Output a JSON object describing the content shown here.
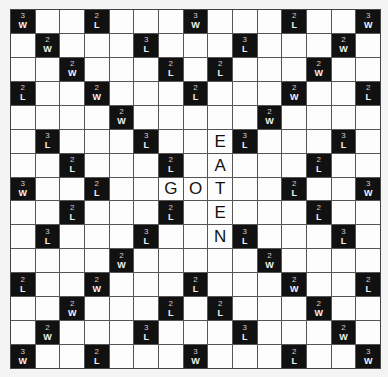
{
  "board": {
    "size": 15,
    "premium_squares": [
      {
        "row": 0,
        "col": 0,
        "mult": "3",
        "kind": "W"
      },
      {
        "row": 0,
        "col": 3,
        "mult": "2",
        "kind": "L"
      },
      {
        "row": 0,
        "col": 7,
        "mult": "3",
        "kind": "W"
      },
      {
        "row": 0,
        "col": 11,
        "mult": "2",
        "kind": "L"
      },
      {
        "row": 0,
        "col": 14,
        "mult": "3",
        "kind": "W"
      },
      {
        "row": 1,
        "col": 1,
        "mult": "2",
        "kind": "W"
      },
      {
        "row": 1,
        "col": 5,
        "mult": "3",
        "kind": "L"
      },
      {
        "row": 1,
        "col": 9,
        "mult": "3",
        "kind": "L"
      },
      {
        "row": 1,
        "col": 13,
        "mult": "2",
        "kind": "W"
      },
      {
        "row": 2,
        "col": 2,
        "mult": "2",
        "kind": "W"
      },
      {
        "row": 2,
        "col": 6,
        "mult": "2",
        "kind": "L"
      },
      {
        "row": 2,
        "col": 8,
        "mult": "2",
        "kind": "L"
      },
      {
        "row": 2,
        "col": 12,
        "mult": "2",
        "kind": "W"
      },
      {
        "row": 3,
        "col": 0,
        "mult": "2",
        "kind": "L"
      },
      {
        "row": 3,
        "col": 3,
        "mult": "2",
        "kind": "W"
      },
      {
        "row": 3,
        "col": 7,
        "mult": "2",
        "kind": "L"
      },
      {
        "row": 3,
        "col": 11,
        "mult": "2",
        "kind": "W"
      },
      {
        "row": 3,
        "col": 14,
        "mult": "2",
        "kind": "L"
      },
      {
        "row": 4,
        "col": 4,
        "mult": "2",
        "kind": "W"
      },
      {
        "row": 4,
        "col": 10,
        "mult": "2",
        "kind": "W"
      },
      {
        "row": 5,
        "col": 1,
        "mult": "3",
        "kind": "L"
      },
      {
        "row": 5,
        "col": 5,
        "mult": "3",
        "kind": "L"
      },
      {
        "row": 5,
        "col": 9,
        "mult": "3",
        "kind": "L"
      },
      {
        "row": 5,
        "col": 13,
        "mult": "3",
        "kind": "L"
      },
      {
        "row": 6,
        "col": 2,
        "mult": "2",
        "kind": "L"
      },
      {
        "row": 6,
        "col": 6,
        "mult": "2",
        "kind": "L"
      },
      {
        "row": 6,
        "col": 12,
        "mult": "2",
        "kind": "L"
      },
      {
        "row": 7,
        "col": 0,
        "mult": "3",
        "kind": "W"
      },
      {
        "row": 7,
        "col": 3,
        "mult": "2",
        "kind": "L"
      },
      {
        "row": 7,
        "col": 11,
        "mult": "2",
        "kind": "L"
      },
      {
        "row": 7,
        "col": 14,
        "mult": "3",
        "kind": "W"
      },
      {
        "row": 8,
        "col": 2,
        "mult": "2",
        "kind": "L"
      },
      {
        "row": 8,
        "col": 6,
        "mult": "2",
        "kind": "L"
      },
      {
        "row": 8,
        "col": 12,
        "mult": "2",
        "kind": "L"
      },
      {
        "row": 9,
        "col": 1,
        "mult": "3",
        "kind": "L"
      },
      {
        "row": 9,
        "col": 5,
        "mult": "3",
        "kind": "L"
      },
      {
        "row": 9,
        "col": 9,
        "mult": "3",
        "kind": "L"
      },
      {
        "row": 9,
        "col": 13,
        "mult": "3",
        "kind": "L"
      },
      {
        "row": 10,
        "col": 4,
        "mult": "2",
        "kind": "W"
      },
      {
        "row": 10,
        "col": 10,
        "mult": "2",
        "kind": "W"
      },
      {
        "row": 11,
        "col": 0,
        "mult": "2",
        "kind": "L"
      },
      {
        "row": 11,
        "col": 3,
        "mult": "2",
        "kind": "W"
      },
      {
        "row": 11,
        "col": 7,
        "mult": "2",
        "kind": "L"
      },
      {
        "row": 11,
        "col": 11,
        "mult": "2",
        "kind": "W"
      },
      {
        "row": 11,
        "col": 14,
        "mult": "2",
        "kind": "L"
      },
      {
        "row": 12,
        "col": 2,
        "mult": "2",
        "kind": "W"
      },
      {
        "row": 12,
        "col": 6,
        "mult": "2",
        "kind": "L"
      },
      {
        "row": 12,
        "col": 8,
        "mult": "2",
        "kind": "L"
      },
      {
        "row": 12,
        "col": 12,
        "mult": "2",
        "kind": "W"
      },
      {
        "row": 13,
        "col": 1,
        "mult": "2",
        "kind": "W"
      },
      {
        "row": 13,
        "col": 5,
        "mult": "3",
        "kind": "L"
      },
      {
        "row": 13,
        "col": 9,
        "mult": "3",
        "kind": "L"
      },
      {
        "row": 13,
        "col": 13,
        "mult": "2",
        "kind": "W"
      },
      {
        "row": 14,
        "col": 0,
        "mult": "3",
        "kind": "W"
      },
      {
        "row": 14,
        "col": 3,
        "mult": "2",
        "kind": "L"
      },
      {
        "row": 14,
        "col": 7,
        "mult": "3",
        "kind": "W"
      },
      {
        "row": 14,
        "col": 11,
        "mult": "2",
        "kind": "L"
      },
      {
        "row": 14,
        "col": 14,
        "mult": "3",
        "kind": "W"
      }
    ],
    "placed_tiles": [
      {
        "row": 7,
        "col": 6,
        "letter": "G"
      },
      {
        "row": 7,
        "col": 7,
        "letter": "O"
      },
      {
        "row": 5,
        "col": 8,
        "letter": "E"
      },
      {
        "row": 6,
        "col": 8,
        "letter": "A"
      },
      {
        "row": 7,
        "col": 8,
        "letter": "T"
      },
      {
        "row": 8,
        "col": 8,
        "letter": "E"
      },
      {
        "row": 9,
        "col": 8,
        "letter": "N"
      }
    ],
    "words": [
      "GOT",
      "EATEN"
    ]
  }
}
